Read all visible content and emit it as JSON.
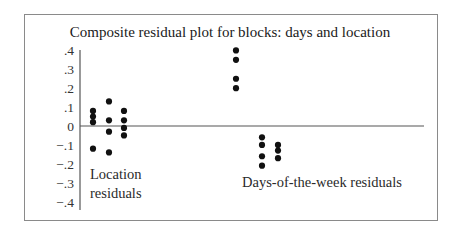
{
  "chart_data": {
    "type": "scatter",
    "title": "Composite residual plot for blocks: days and location",
    "xlabel": "",
    "ylabel": "",
    "ylim": [
      -0.4,
      0.4
    ],
    "yticks": [
      0.4,
      0.3,
      0.2,
      0.1,
      0,
      -0.1,
      -0.2,
      -0.3,
      -0.4
    ],
    "ytick_labels": [
      ".4",
      ".3",
      ".2",
      ".1",
      "0",
      "−.1",
      "−.2",
      "−.3",
      "−.4"
    ],
    "grid": false,
    "reference_line": 0,
    "groups": [
      {
        "name": "Location residuals",
        "label_lines": [
          "Location",
          "residuals"
        ],
        "columns": [
          {
            "values": [
              0.08,
              0.05,
              0.02,
              -0.12
            ]
          },
          {
            "values": [
              0.13,
              0.03,
              -0.03,
              -0.14
            ]
          },
          {
            "values": [
              0.08,
              0.03,
              -0.01,
              -0.05
            ]
          }
        ]
      },
      {
        "name": "Days-of-the-week residuals",
        "label_lines": [
          "Days-of-the-week residuals"
        ],
        "columns": [
          {
            "values": [
              0.4,
              0.35,
              0.25,
              0.2
            ]
          },
          {
            "values": [
              -0.06,
              -0.1,
              -0.16,
              -0.21
            ]
          },
          {
            "values": [
              -0.1,
              -0.13,
              -0.17
            ]
          }
        ]
      }
    ]
  }
}
